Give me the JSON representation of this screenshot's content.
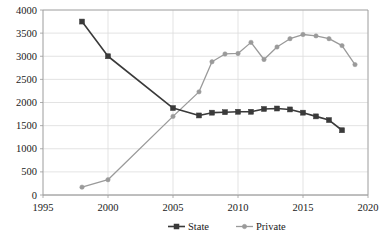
{
  "chart_data": {
    "type": "line",
    "title": "",
    "subtitle": "",
    "xlabel": "",
    "ylabel": "",
    "xlim": [
      1995,
      2020
    ],
    "ylim": [
      0,
      4000
    ],
    "xticks": [
      "1995",
      "2000",
      "2005",
      "2010",
      "2015",
      "2020"
    ],
    "xtick_values": [
      1995,
      2000,
      2005,
      2010,
      2015,
      2020
    ],
    "yticks": [
      "0",
      "500",
      "1000",
      "1500",
      "2000",
      "2500",
      "3000",
      "3500",
      "4000"
    ],
    "ytick_values": [
      0,
      500,
      1000,
      1500,
      2000,
      2500,
      3000,
      3500,
      4000
    ],
    "grid": true,
    "grid_axis": "y",
    "legend_position": "bottom-center",
    "series": [
      {
        "name": "State",
        "color": "#3a3a3a",
        "marker": "square",
        "x": [
          1998,
          2000,
          2005,
          2007,
          2008,
          2009,
          2010,
          2011,
          2012,
          2013,
          2014,
          2015,
          2016,
          2017,
          2018
        ],
        "values": [
          3750,
          3000,
          1880,
          1720,
          1780,
          1790,
          1800,
          1800,
          1860,
          1870,
          1850,
          1780,
          1700,
          1620,
          1400
        ]
      },
      {
        "name": "Private",
        "color": "#9a9a9a",
        "marker": "circle",
        "x": [
          1998,
          2000,
          2005,
          2007,
          2008,
          2009,
          2010,
          2011,
          2012,
          2013,
          2014,
          2015,
          2016,
          2017,
          2018
        ],
        "values": [
          170,
          330,
          1700,
          2230,
          2880,
          3050,
          3060,
          3300,
          2930,
          3200,
          3380,
          3470,
          3440,
          3380,
          3230
        ],
        "values_note": "tail"
      }
    ],
    "series_tail": {
      "name": "Private",
      "x": [
        2019
      ],
      "values": [
        2820
      ]
    },
    "legend": [
      {
        "label": "State",
        "color": "#3a3a3a",
        "marker": "square"
      },
      {
        "label": "Private",
        "color": "#9a9a9a",
        "marker": "circle"
      }
    ],
    "axis_color": "#9a9a9a",
    "grid_color": "#dcdcdc",
    "background": "#ffffff"
  }
}
